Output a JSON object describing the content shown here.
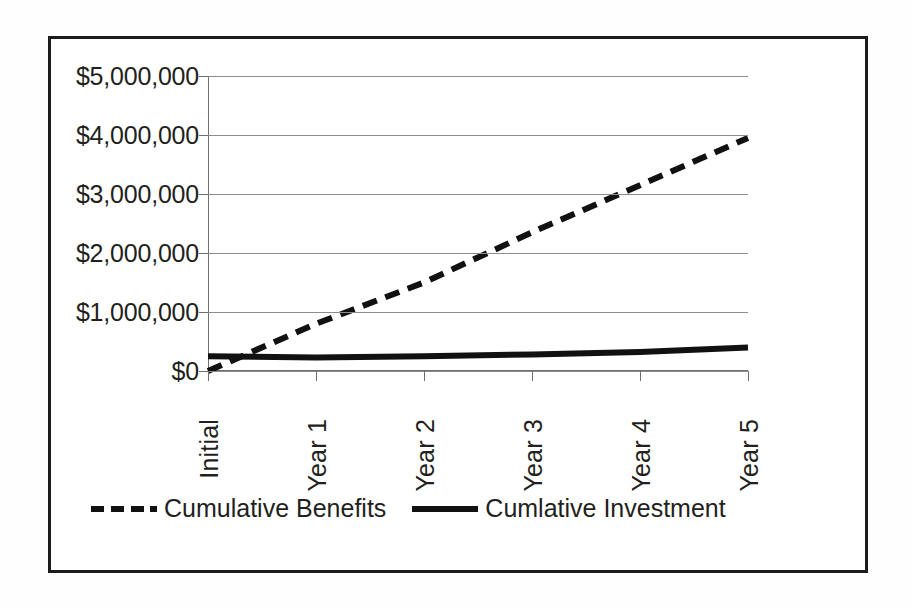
{
  "chart_data": {
    "type": "line",
    "title": "",
    "subtitle": "",
    "xlabel": "",
    "ylabel": "",
    "categories": [
      "Initial",
      "Year 1",
      "Year 2",
      "Year 3",
      "Year 4",
      "Year 5"
    ],
    "series": [
      {
        "name": "Cumulative Benefits",
        "style": "dashed",
        "color": "#111111",
        "values": [
          0,
          800000,
          1500000,
          2350000,
          3150000,
          3950000
        ]
      },
      {
        "name": "Cumlative Investment",
        "style": "solid",
        "color": "#111111",
        "values": [
          250000,
          230000,
          250000,
          280000,
          320000,
          400000
        ]
      }
    ],
    "ylim": [
      0,
      5000000
    ],
    "y_ticks": [
      0,
      1000000,
      2000000,
      3000000,
      4000000,
      5000000
    ],
    "y_tick_labels": [
      "$0",
      "$1,000,000",
      "$2,000,000",
      "$3,000,000",
      "$4,000,000",
      "$5,000,000"
    ],
    "grid": true,
    "grid_axis": "y",
    "legend_position": "bottom-left"
  },
  "legend": {
    "entries": [
      {
        "label": "Cumulative Benefits",
        "style": "dashed"
      },
      {
        "label": "Cumlative Investment",
        "style": "solid"
      }
    ]
  }
}
